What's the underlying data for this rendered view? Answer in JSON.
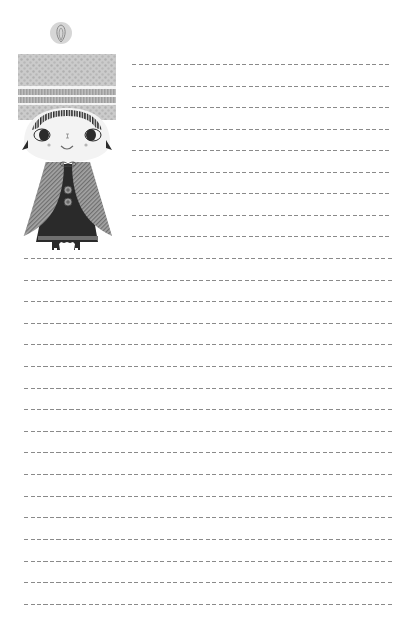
{
  "page": {
    "type": "lined-stationery",
    "background": "#ffffff"
  },
  "illustration": {
    "subject": "girl-in-knit-hat-and-cape",
    "colors": {
      "hat": "#c9c9c9",
      "hat_dots": "#b3b3b3",
      "pompom": "#d4d4d4",
      "face": "#f3f3f3",
      "hair": "#2b2b2b",
      "cape": "#8e8e8e",
      "dress": "#2a2a2a",
      "buttons": "#9a9a9a"
    }
  },
  "lines": {
    "color": "#8a8a8a",
    "spacing": 21.6,
    "short": {
      "x_start": 132,
      "x_end": 392,
      "ys": [
        64,
        86,
        107,
        129,
        150,
        172,
        193,
        215,
        236
      ]
    },
    "full": {
      "x_start": 24,
      "x_end": 392,
      "ys": [
        258,
        280,
        301,
        323,
        344,
        366,
        388,
        409,
        431,
        452,
        474,
        496,
        517,
        539,
        561,
        582,
        604
      ]
    }
  }
}
